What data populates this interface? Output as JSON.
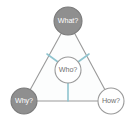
{
  "diagram": {
    "canvas": {
      "width": 135,
      "height": 126,
      "background": "#ffffff"
    },
    "triangle": {
      "name": "triangle-outline",
      "stroke": "#9a9a9a",
      "fill": "#fcfdfd",
      "apex": {
        "x": 68,
        "y": 21
      },
      "bottom_left": {
        "x": 24,
        "y": 101
      },
      "bottom_right": {
        "x": 111,
        "y": 101
      }
    },
    "colors": {
      "node_filled": "#8f8f8f",
      "node_filled_border": "#7a7a7a",
      "node_open": "#ffffff",
      "node_open_border": "#9a9a9a",
      "spoke": "#8fc4cf",
      "edge": "#9a9a9a",
      "label_light": "#ffffff",
      "label_dark": "#6f6f6f"
    },
    "nodes": [
      {
        "id": "what",
        "label": "What?",
        "position": "top",
        "cx": 68,
        "cy": 21,
        "r": 14,
        "style": "filled",
        "fill": "#8f8f8f",
        "border": "#7a7a7a",
        "text_color": "#ffffff"
      },
      {
        "id": "who",
        "label": "Who?",
        "position": "center",
        "cx": 68,
        "cy": 70,
        "r": 13,
        "style": "open",
        "fill": "#ffffff",
        "border": "#9a9a9a",
        "text_color": "#6f6f6f"
      },
      {
        "id": "why",
        "label": "Why?",
        "position": "bottom-left",
        "cx": 24,
        "cy": 101,
        "r": 13,
        "style": "filled",
        "fill": "#8f8f8f",
        "border": "#7a7a7a",
        "text_color": "#ffffff"
      },
      {
        "id": "how",
        "label": "How?",
        "position": "bottom-right",
        "cx": 111,
        "cy": 101,
        "r": 13,
        "style": "open",
        "fill": "#ffffff",
        "border": "#9a9a9a",
        "text_color": "#6f6f6f"
      }
    ],
    "spokes": [
      {
        "id": "who-to-upper-left",
        "from": "who",
        "to_edge": "left-edge",
        "x1": 58,
        "y1": 62,
        "x2": 48,
        "y2": 55,
        "color": "#8fc4cf"
      },
      {
        "id": "who-to-upper-right",
        "from": "who",
        "to_edge": "right-edge",
        "x1": 78,
        "y1": 62,
        "x2": 88,
        "y2": 55,
        "color": "#8fc4cf"
      },
      {
        "id": "who-to-bottom",
        "from": "who",
        "to_edge": "bottom-edge",
        "x1": 68,
        "y1": 83,
        "x2": 68,
        "y2": 101,
        "color": "#8fc4cf"
      }
    ]
  }
}
